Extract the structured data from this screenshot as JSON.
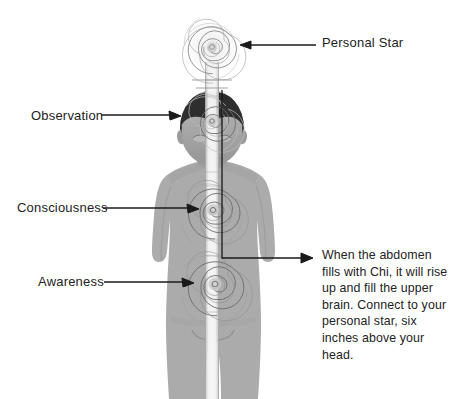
{
  "diagram": {
    "background_color": "#ffffff",
    "body_color": "#ababab",
    "hair_color": "#2e2e2e",
    "line_color": "#1a1a1a",
    "text_color": "#232323"
  },
  "labels": {
    "personal_star": "Personal Star",
    "observation": "Observation",
    "consciousness": "Consciousness",
    "awareness": "Awareness"
  },
  "note": {
    "text": "When the abdomen fills with Chi, it will rise up and fill the upper brain. Connect to your personal star, six inches above your head."
  },
  "energy_centers": [
    {
      "name": "personal-star",
      "label": "Personal Star",
      "cx": 212,
      "cy": 48,
      "radius": 29
    },
    {
      "name": "observation",
      "label": "Observation",
      "cx": 212,
      "cy": 122,
      "radius": 25
    },
    {
      "name": "consciousness",
      "label": "Consciousness",
      "cx": 213,
      "cy": 211,
      "radius": 30
    },
    {
      "name": "awareness",
      "label": "Awareness",
      "cx": 215,
      "cy": 285,
      "radius": 33
    }
  ]
}
